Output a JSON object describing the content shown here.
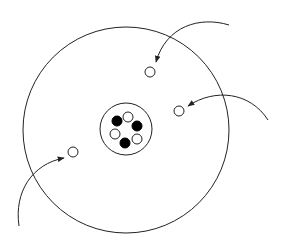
{
  "diagram": {
    "title": "",
    "colors": {
      "stroke": "#222222",
      "filled_particle": "#000000",
      "hollow_particle": "#ffffff",
      "background": "#ffffff"
    },
    "nucleus": {
      "filled_count": 3,
      "hollow_count": 3,
      "particles": [
        "filled",
        "hollow",
        "filled",
        "hollow",
        "filled",
        "hollow"
      ]
    },
    "outer_particles": [
      {
        "type": "hollow",
        "arrow": "from top-right"
      },
      {
        "type": "hollow",
        "arrow": "from right"
      },
      {
        "type": "hollow",
        "arrow": "from bottom-left"
      }
    ],
    "arrow_count": 3
  }
}
